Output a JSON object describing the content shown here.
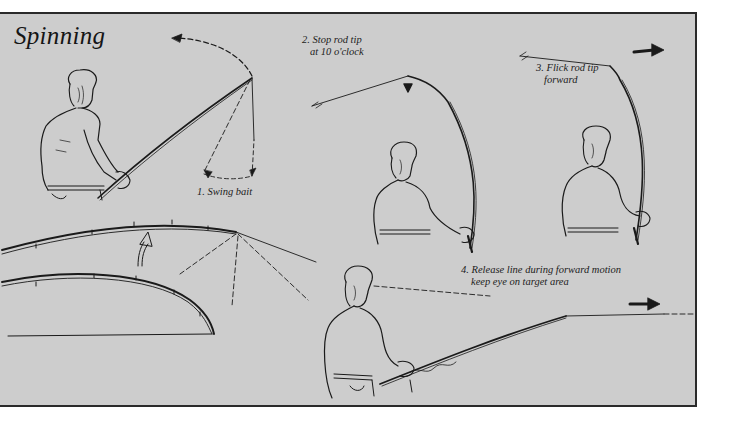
{
  "title": "Spinning",
  "steps": [
    {
      "number": "1.",
      "lines": [
        "1. Swing bait"
      ]
    },
    {
      "number": "2.",
      "lines": [
        "2. Stop rod tip",
        "at 10 o'clock"
      ]
    },
    {
      "number": "3.",
      "lines": [
        "3. Flick rod tip",
        "forward"
      ]
    },
    {
      "number": "4.",
      "lines": [
        "4. Release line during forward motion",
        "keep eye on target area"
      ]
    }
  ],
  "colors": {
    "panel_background": "#cdcdcd",
    "ink": "#1a1a1a",
    "page_background": "#ffffff"
  },
  "icons": {
    "motion_arrow_1": "dashed-curved-arrow-icon",
    "motion_arrow_2": "up-arrow-icon",
    "motion_arrow_3": "right-arrow-icon",
    "motion_arrow_4": "right-arrow-icon",
    "rod_lift_arrow": "curved-up-arrow-icon"
  }
}
